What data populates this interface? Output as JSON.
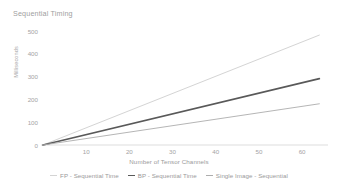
{
  "chart_data": {
    "type": "line",
    "title": "Sequential Timing",
    "xlabel": "Number of Tensor Channels",
    "ylabel": "Milliseconds",
    "xlim": [
      0,
      66
    ],
    "ylim": [
      0,
      500
    ],
    "xticks": [
      "10",
      "20",
      "30",
      "40",
      "50",
      "60"
    ],
    "xtick_values": [
      10,
      20,
      30,
      40,
      50,
      60
    ],
    "yticks": [
      "0",
      "100",
      "200",
      "300",
      "400",
      "500"
    ],
    "ytick_values": [
      0,
      100,
      200,
      300,
      400,
      500
    ],
    "grid": false,
    "legend_position": "bottom-center",
    "x": [
      0,
      64
    ],
    "series": [
      {
        "name": "FP - Sequential Time",
        "color": "#d4d4d4",
        "width": 1.0,
        "values": [
          0,
          480
        ]
      },
      {
        "name": "BP - Sequential Time",
        "color": "#595959",
        "width": 1.7,
        "values": [
          0,
          290
        ]
      },
      {
        "name": "Single Image - Sequential",
        "color": "#adadad",
        "width": 0.9,
        "values": [
          0,
          180
        ]
      }
    ],
    "axis_color": "#d9d9d9",
    "text_color": "#a4a4a4"
  },
  "legend": {
    "items": [
      {
        "label": "FP - Sequential Time"
      },
      {
        "label": "BP - Sequential Time"
      },
      {
        "label": "Single Image - Sequential"
      }
    ]
  }
}
